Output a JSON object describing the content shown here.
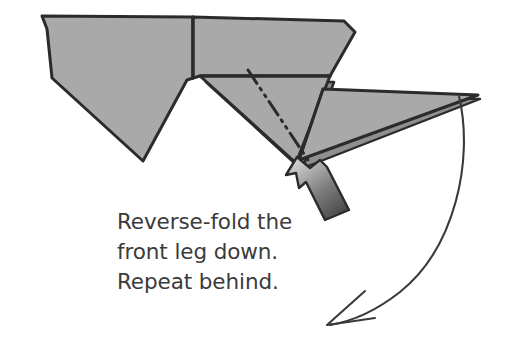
{
  "figure": {
    "type": "origami-instruction-diagram",
    "background_color": "#ffffff",
    "paper_fill_color": "#a9a9a9",
    "paper_fill_shaded_color": "#9a9a9a",
    "outline_color": "#2b2b2b",
    "text_color": "#3b3b3b"
  },
  "caption": {
    "full_text": "Reverse-fold the front leg down. Repeat behind.",
    "lines": [
      "Reverse-fold the",
      "front leg down.",
      "Repeat behind."
    ],
    "line1": "Reverse-fold the",
    "line2": "front leg down.",
    "line3": "Repeat behind."
  },
  "annotations": {
    "crease_line": {
      "name": "dash-dot-dot-fold-line",
      "style": "dash-dot-dot",
      "meaning": "reverse fold crease",
      "from": [
        248,
        70
      ],
      "to": [
        310,
        163
      ]
    },
    "push_arrow": {
      "name": "push-arrow",
      "meaning": "push here",
      "direction": "up-left",
      "tip": [
        297,
        158
      ],
      "tail": [
        352,
        208
      ]
    },
    "motion_arrow": {
      "name": "curved-motion-arrow",
      "meaning": "fold the leg down in this direction",
      "start": [
        459,
        96
      ],
      "end": [
        327,
        325
      ],
      "head_style": "open-v"
    }
  },
  "shapes": {
    "left_body": {
      "name": "left-body-panel",
      "points": "42,16 193,17 193,78 187,80 143,161 52,78 47,30"
    },
    "upper_right_body": {
      "name": "upper-right-body-panel",
      "points": "193,17 345,21 355,31 352,23 330,76 200,76 193,78"
    },
    "lower_triangle": {
      "name": "lower-front-triangle-panel",
      "points": "200,76 330,76 296,163"
    },
    "leg_triangle": {
      "name": "front-leg-triangle",
      "points": "323,89 478,95 300,161"
    }
  }
}
